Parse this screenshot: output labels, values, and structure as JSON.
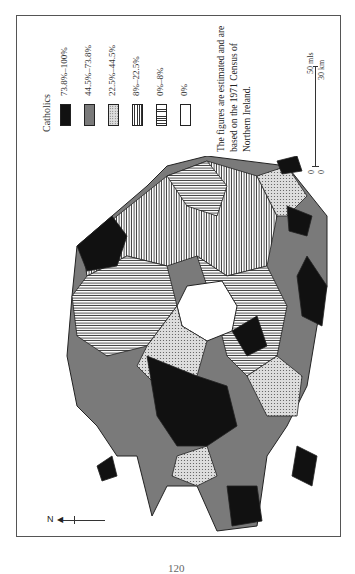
{
  "map": {
    "orientation": "rotated 90° (north points left)",
    "subject": "Northern Ireland",
    "legend": {
      "title": "Catholics",
      "items": [
        {
          "label": "73.8%–100%",
          "pattern": "solid-black",
          "color": "#111111"
        },
        {
          "label": "44.5%–73.8%",
          "pattern": "solid-grey",
          "color": "#7a7a7a"
        },
        {
          "label": "22.5%–44.5%",
          "pattern": "stipple-dots",
          "color": "#dddddd"
        },
        {
          "label": "8%–22.5%",
          "pattern": "vertical-lines",
          "color": "#333333"
        },
        {
          "label": "0%–8%",
          "pattern": "horizontal-lines",
          "color": "#333333"
        },
        {
          "label": "0%",
          "pattern": "white",
          "color": "#ffffff"
        }
      ]
    },
    "note": {
      "line1": "The figures are estimated and are",
      "line2": "based on the 1971  Census of",
      "line3": "Northern Ireland."
    },
    "scale_bar": {
      "top_left": "0",
      "top_right": "0",
      "miles_label": "50 mls",
      "km_label": "30 km"
    },
    "north_arrow": {
      "label": "N"
    }
  },
  "page": {
    "number": "120"
  }
}
